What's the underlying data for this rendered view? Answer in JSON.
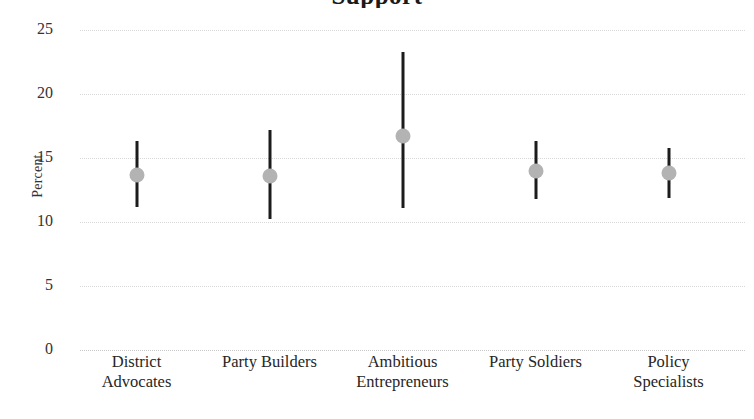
{
  "chart_data": {
    "type": "scatter",
    "title": "Support",
    "xlabel": "",
    "ylabel": "Percent",
    "ylim": [
      0,
      25
    ],
    "yticks": [
      0,
      5,
      10,
      15,
      20,
      25
    ],
    "ytick_labels": [
      "0",
      "5",
      "10",
      "15",
      "20",
      "25"
    ],
    "grid": true,
    "grid_axis": "y",
    "legend": false,
    "marker_color": "#b3b3b3",
    "errorbar_color": "#1c1c1c",
    "categories": [
      "District Advocates",
      "Party Builders",
      "Ambitious Entrepreneurs",
      "Party Soldiers",
      "Policy Specialists"
    ],
    "category_lines": [
      [
        "District",
        "Advocates"
      ],
      [
        "Party Builders",
        ""
      ],
      [
        "Ambitious",
        "Entrepreneurs"
      ],
      [
        "Party Soldiers",
        ""
      ],
      [
        "Policy",
        "Specialists"
      ]
    ],
    "values": [
      13.7,
      13.6,
      16.7,
      14.0,
      13.8
    ],
    "ci_low": [
      11.2,
      10.2,
      11.1,
      11.8,
      11.9
    ],
    "ci_high": [
      16.3,
      17.2,
      23.3,
      16.3,
      15.8
    ]
  }
}
